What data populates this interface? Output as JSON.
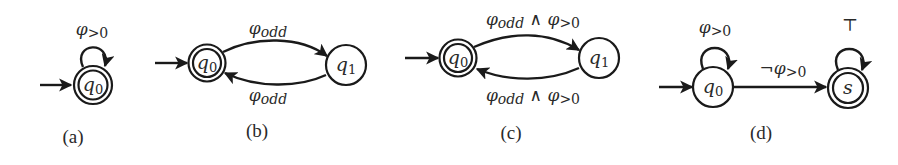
{
  "figure": {
    "panels": [
      {
        "caption": "(a)",
        "states": [
          {
            "id": "q0",
            "label": "q",
            "sub": "0",
            "initial": true,
            "accepting": true
          }
        ],
        "transitions": [
          {
            "from": "q0",
            "to": "q0",
            "label_main": "φ",
            "label_sub": ">0"
          }
        ]
      },
      {
        "caption": "(b)",
        "states": [
          {
            "id": "q0",
            "label": "q",
            "sub": "0",
            "initial": true,
            "accepting": true
          },
          {
            "id": "q1",
            "label": "q",
            "sub": "1",
            "initial": false,
            "accepting": false
          }
        ],
        "transitions": [
          {
            "from": "q0",
            "to": "q1",
            "label_main": "φ",
            "label_sub": "odd"
          },
          {
            "from": "q1",
            "to": "q0",
            "label_main": "φ",
            "label_sub": "odd"
          }
        ]
      },
      {
        "caption": "(c)",
        "states": [
          {
            "id": "q0",
            "label": "q",
            "sub": "0",
            "initial": true,
            "accepting": true
          },
          {
            "id": "q1",
            "label": "q",
            "sub": "1",
            "initial": false,
            "accepting": false
          }
        ],
        "transitions": [
          {
            "from": "q0",
            "to": "q1",
            "label_main": "φ",
            "label_sub": "odd",
            "conj": " ∧ ",
            "label_main2": "φ",
            "label_sub2": ">0"
          },
          {
            "from": "q1",
            "to": "q0",
            "label_main": "φ",
            "label_sub": "odd",
            "conj": " ∧ ",
            "label_main2": "φ",
            "label_sub2": ">0"
          }
        ]
      },
      {
        "caption": "(d)",
        "states": [
          {
            "id": "q0",
            "label": "q",
            "sub": "0",
            "initial": true,
            "accepting": false
          },
          {
            "id": "s",
            "label": "s",
            "sub": "",
            "initial": false,
            "accepting": true
          }
        ],
        "transitions": [
          {
            "from": "q0",
            "to": "q0",
            "label_main": "φ",
            "label_sub": ">0"
          },
          {
            "from": "q0",
            "to": "s",
            "neg": "¬",
            "label_main": "φ",
            "label_sub": ">0"
          },
          {
            "from": "s",
            "to": "s",
            "label_main": "⊤",
            "label_sub": ""
          }
        ]
      }
    ]
  }
}
